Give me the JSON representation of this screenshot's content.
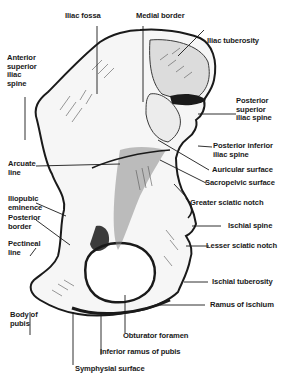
{
  "diagram": {
    "colors": {
      "ink": "#1a1a1a",
      "background": "#ffffff",
      "shade": "#3a3a3a"
    },
    "labels": {
      "iliac_fossa": "Iliac fossa",
      "medial_border": "Medial border",
      "iliac_tuberosity": "Iliac tuberosity",
      "anterior_superior_iliac_spine": "Anterior\nsuperior\niliac\nspine",
      "posterior_superior_iliac_spine": "Posterior\nsuperior\niliac spine",
      "posterior_inferior_iliac_spine": "Posterior inferior\niliac spine",
      "auricular_surface": "Auricular surface",
      "sacropelvic_surface": "Sacropelvic surface",
      "arcuate_line": "Arcuate\nline",
      "greater_sciatic_notch": "Greater sciatic notch",
      "iliopubic_eminence": "Iliopubic\neminence",
      "posterior_border": "Posterior\nborder",
      "pectineal_line": "Pectineal\nline",
      "ischial_spine": "Ischial spine",
      "lesser_sciatic_notch": "Lesser sciatic notch",
      "ischial_tuberosity": "Ischial tuberosity",
      "body_of_pubis": "Body of\npubis",
      "ramus_of_ischium": "Ramus of ischium",
      "obturator_foramen": "Obturator foramen",
      "inferior_ramus_of_pubis": "Inferior ramus of pubis",
      "symphysial_surface": "Symphysial surface"
    }
  }
}
